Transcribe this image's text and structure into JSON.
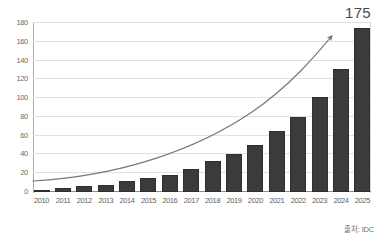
{
  "chart_data": {
    "type": "bar",
    "title": "",
    "subtitle": "",
    "xlabel": "",
    "ylabel": "",
    "ylim": [
      0,
      180
    ],
    "yticks": [
      0,
      20,
      40,
      60,
      80,
      100,
      120,
      140,
      160,
      180
    ],
    "grid": true,
    "legend": null,
    "categories": [
      "2010",
      "2011",
      "2012",
      "2013",
      "2014",
      "2015",
      "2016",
      "2017",
      "2018",
      "2019",
      "2020",
      "2021",
      "2022",
      "2023",
      "2024",
      "2025"
    ],
    "values": [
      2,
      4,
      6,
      8,
      12,
      15,
      18,
      25,
      33,
      41,
      50,
      65,
      80,
      101,
      131,
      175
    ],
    "series": [
      {
        "name": "Annual value",
        "values": [
          2,
          4,
          6,
          8,
          12,
          15,
          18,
          25,
          33,
          41,
          50,
          65,
          80,
          101,
          131,
          175
        ]
      }
    ],
    "annotations": [
      {
        "name": "peak-value-label",
        "text": "175",
        "position": "top-right"
      },
      {
        "name": "growth-arrow",
        "text": "",
        "description": "exponential trend curve with arrowhead"
      }
    ],
    "source_note": "출처: IDC",
    "colors": {
      "bar": "#3b3b3d",
      "bar_border": "#2f2f31",
      "grid": "#e2e2e4",
      "axis": "#a9a9ab",
      "trend_curve": "#77777a",
      "tick_text": "#6b6b6e",
      "label_text": "#4a4a4d",
      "background": "#ffffff"
    }
  }
}
